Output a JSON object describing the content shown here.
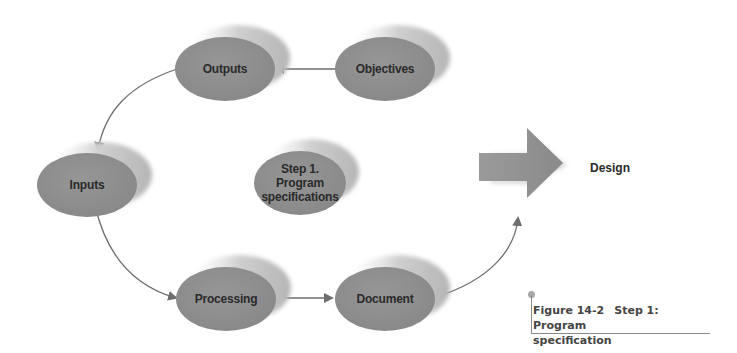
{
  "diagram": {
    "nodes": [
      {
        "id": "outputs",
        "label": "Outputs"
      },
      {
        "id": "objectives",
        "label": "Objectives"
      },
      {
        "id": "inputs",
        "label": "Inputs"
      },
      {
        "id": "center",
        "label_lines": [
          "Step 1.",
          "Program",
          "specifications"
        ]
      },
      {
        "id": "processing",
        "label": "Processing"
      },
      {
        "id": "document",
        "label": "Document"
      }
    ],
    "edges": [
      {
        "from": "objectives",
        "to": "outputs"
      },
      {
        "from": "outputs",
        "to": "inputs"
      },
      {
        "from": "inputs",
        "to": "processing"
      },
      {
        "from": "processing",
        "to": "document"
      },
      {
        "from": "document",
        "to": "design"
      }
    ],
    "next_step": {
      "label": "Design",
      "icon": "right-arrow-icon"
    },
    "colors": {
      "node_fill": "#8f8f8f",
      "node_shadow": "#d0d0d0",
      "edge": "#6e6e6e",
      "text": "#2a2a2a"
    }
  },
  "caption": {
    "figure_number": "Figure 14-2",
    "title_line1": "Step 1: Program",
    "title_line2": "specification"
  }
}
